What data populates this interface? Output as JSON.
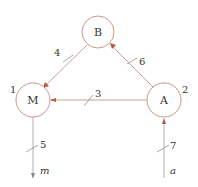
{
  "diagram": {
    "type": "directed-graph",
    "colors": {
      "node_stroke": "#c9968a",
      "edge_stroke": "#c9968a",
      "arrowhead": "#b65a45",
      "text": "#333333"
    },
    "nodes": [
      {
        "id": "B",
        "label": "B",
        "number": ""
      },
      {
        "id": "M",
        "label": "M",
        "number": "1"
      },
      {
        "id": "A",
        "label": "A",
        "number": "2"
      }
    ],
    "edges": [
      {
        "id": "3",
        "label": "3",
        "from": "A",
        "to": "M"
      },
      {
        "id": "4",
        "label": "4",
        "from": "B",
        "to": "M"
      },
      {
        "id": "5",
        "label": "5",
        "from": "M",
        "to": "m"
      },
      {
        "id": "6",
        "label": "6",
        "from": "A",
        "to": "B"
      },
      {
        "id": "7",
        "label": "7",
        "from": "a",
        "to": "A"
      }
    ],
    "terminals": [
      {
        "id": "m",
        "label": "m"
      },
      {
        "id": "a",
        "label": "a"
      }
    ]
  }
}
